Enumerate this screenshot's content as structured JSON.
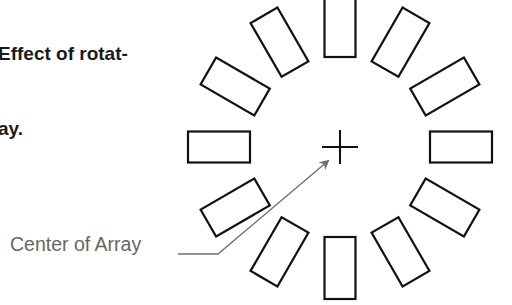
{
  "caption": {
    "line1": "Effect of rotat-",
    "line2": "ay."
  },
  "label": {
    "text": "Center of Array"
  },
  "diagram": {
    "center": {
      "x": 340,
      "y": 147
    },
    "radius": 121,
    "element_count": 12,
    "element_size": {
      "long": 62,
      "short": 31
    },
    "angle_step_deg": 30,
    "stroke_color": "#111111",
    "leader_color": "#707070",
    "crosshair_half": 18
  }
}
